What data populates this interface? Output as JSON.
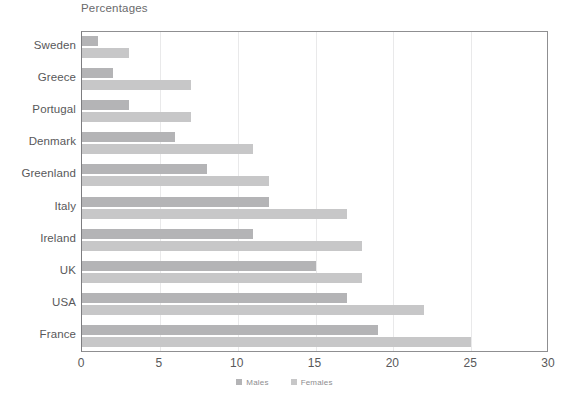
{
  "chart_data": {
    "type": "bar",
    "orientation": "horizontal",
    "title": "Percentages",
    "xlabel": "",
    "ylabel": "",
    "xlim": [
      0,
      30
    ],
    "xticks": [
      0,
      5,
      10,
      15,
      20,
      25,
      30
    ],
    "grid": true,
    "legend_position": "bottom",
    "categories": [
      "Sweden",
      "Greece",
      "Portugal",
      "Denmark",
      "Greenland",
      "Italy",
      "Ireland",
      "UK",
      "USA",
      "France"
    ],
    "series": [
      {
        "name": "Males",
        "color": "#b4b4b6",
        "values": [
          1,
          2,
          3,
          6,
          8,
          12,
          11,
          15,
          17,
          19
        ]
      },
      {
        "name": "Females",
        "color": "#c7c7c8",
        "values": [
          3,
          7,
          7,
          11,
          12,
          17,
          18,
          18,
          22,
          25
        ]
      }
    ]
  },
  "legend": {
    "items": [
      {
        "label": "Males",
        "color": "#b4b4b6"
      },
      {
        "label": "Females",
        "color": "#c7c7c8"
      }
    ]
  },
  "axis": {
    "tick_labels": [
      "0",
      "5",
      "10",
      "15",
      "20",
      "25",
      "30"
    ]
  }
}
